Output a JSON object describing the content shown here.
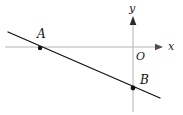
{
  "figure": {
    "type": "coordinate-plane-line-diagram",
    "width": 183,
    "height": 115,
    "background_color": "#ffffff",
    "axes": {
      "color": "#b3b3b3",
      "origin_label": "O",
      "origin_px": {
        "x": 133,
        "y": 47
      },
      "x_axis": {
        "label": "x",
        "start_px": {
          "x": 5,
          "y": 47
        },
        "end_px": {
          "x": 163,
          "y": 47
        },
        "arrow": "right"
      },
      "y_axis": {
        "label": "y",
        "start_px": {
          "x": 133,
          "y": 112
        },
        "end_px": {
          "x": 133,
          "y": 17
        },
        "arrow": "up"
      }
    },
    "line": {
      "color": "#111111",
      "stroke_width": 1.3,
      "start_px": {
        "x": 8,
        "y": 32
      },
      "end_px": {
        "x": 160,
        "y": 98
      },
      "description": "straight line with negative slope crossing the x-axis at A and the y-axis at B"
    },
    "points": [
      {
        "label": "A",
        "px": {
          "x": 40,
          "y": 48
        },
        "on": "x-axis",
        "marker": "filled-dot",
        "marker_color": "#111111",
        "label_offset_px": {
          "x": -3,
          "y": -18
        }
      },
      {
        "label": "B",
        "px": {
          "x": 133,
          "y": 88
        },
        "on": "y-axis",
        "marker": "filled-dot",
        "marker_color": "#111111",
        "label_offset_px": {
          "x": 7,
          "y": -12
        }
      }
    ]
  }
}
